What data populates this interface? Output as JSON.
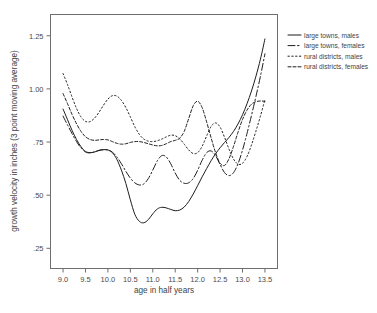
{
  "chart_data": {
    "type": "line",
    "title": "",
    "xlabel": "age in half years",
    "ylabel": "growth velocity in inches (3 point moving average)",
    "xlim": [
      8.72,
      13.78
    ],
    "ylim": [
      0.155,
      1.35
    ],
    "grid": false,
    "legend_position": "right-outside",
    "xticks": [
      "9.0",
      "9.5",
      "10.0",
      "10.5",
      "11.0",
      "11.5",
      "12.0",
      "12.5",
      "13.0",
      "13.5"
    ],
    "xtick_values": [
      9.0,
      9.5,
      10.0,
      10.5,
      11.0,
      11.5,
      12.0,
      12.5,
      13.0,
      13.5
    ],
    "yticks": [
      ".25",
      ".50",
      ".75",
      "1.00",
      "1.25"
    ],
    "ytick_values": [
      0.25,
      0.5,
      0.75,
      1.0,
      1.25
    ],
    "series": [
      {
        "name": "large towns, males",
        "style": "solid",
        "dash": "none",
        "color": "#1d1d1d",
        "x": [
          9.0,
          9.1,
          9.2,
          9.3,
          9.4,
          9.5,
          9.6,
          9.7,
          9.8,
          9.9,
          10.0,
          10.1,
          10.2,
          10.3,
          10.4,
          10.5,
          10.6,
          10.7,
          10.8,
          10.9,
          11.0,
          11.1,
          11.2,
          11.3,
          11.4,
          11.5,
          11.6,
          11.7,
          11.8,
          11.9,
          12.0,
          12.1,
          12.2,
          12.3,
          12.4,
          12.5,
          12.6,
          12.7,
          12.8,
          12.9,
          13.0,
          13.1,
          13.2,
          13.3,
          13.4,
          13.5
        ],
        "y": [
          0.905,
          0.855,
          0.805,
          0.762,
          0.728,
          0.706,
          0.7,
          0.703,
          0.71,
          0.714,
          0.713,
          0.7,
          0.668,
          0.618,
          0.555,
          0.478,
          0.41,
          0.377,
          0.37,
          0.385,
          0.412,
          0.435,
          0.443,
          0.44,
          0.433,
          0.427,
          0.43,
          0.444,
          0.47,
          0.505,
          0.545,
          0.586,
          0.625,
          0.662,
          0.695,
          0.723,
          0.748,
          0.772,
          0.8,
          0.835,
          0.878,
          0.93,
          0.99,
          1.06,
          1.14,
          1.235
        ]
      },
      {
        "name": "large towns, females",
        "style": "dash-dot",
        "dash": "7,2.5,1.5,2.5",
        "color": "#1d1d1d",
        "x": [
          9.0,
          9.1,
          9.2,
          9.3,
          9.4,
          9.5,
          9.6,
          9.7,
          9.8,
          9.9,
          10.0,
          10.1,
          10.2,
          10.3,
          10.4,
          10.5,
          10.6,
          10.7,
          10.8,
          10.9,
          11.0,
          11.1,
          11.2,
          11.3,
          11.4,
          11.5,
          11.6,
          11.7,
          11.8,
          11.9,
          12.0,
          12.1,
          12.2,
          12.3,
          12.4,
          12.5,
          12.6,
          12.7,
          12.8,
          12.9,
          13.0,
          13.1,
          13.2,
          13.3,
          13.4,
          13.5
        ],
        "y": [
          0.872,
          0.83,
          0.79,
          0.752,
          0.722,
          0.703,
          0.699,
          0.704,
          0.711,
          0.714,
          0.712,
          0.702,
          0.68,
          0.648,
          0.612,
          0.58,
          0.558,
          0.548,
          0.553,
          0.578,
          0.618,
          0.661,
          0.686,
          0.68,
          0.648,
          0.604,
          0.57,
          0.556,
          0.558,
          0.578,
          0.617,
          0.664,
          0.7,
          0.708,
          0.686,
          0.644,
          0.606,
          0.592,
          0.606,
          0.648,
          0.712,
          0.79,
          0.875,
          0.965,
          1.06,
          1.165
        ]
      },
      {
        "name": "rural districts, males",
        "style": "dotted",
        "dash": "1.4,2.4",
        "color": "#1d1d1d",
        "x": [
          9.0,
          9.1,
          9.2,
          9.3,
          9.4,
          9.5,
          9.6,
          9.7,
          9.8,
          9.9,
          10.0,
          10.1,
          10.2,
          10.3,
          10.4,
          10.5,
          10.6,
          10.7,
          10.8,
          10.9,
          11.0,
          11.1,
          11.2,
          11.3,
          11.4,
          11.5,
          11.6,
          11.7,
          11.8,
          11.9,
          12.0,
          12.1,
          12.2,
          12.3,
          12.4,
          12.5,
          12.6,
          12.7,
          12.8,
          12.9,
          13.0,
          13.1,
          13.2,
          13.3,
          13.4,
          13.5
        ],
        "y": [
          1.072,
          1.02,
          0.962,
          0.908,
          0.868,
          0.847,
          0.846,
          0.862,
          0.89,
          0.923,
          0.952,
          0.968,
          0.966,
          0.946,
          0.912,
          0.868,
          0.822,
          0.786,
          0.764,
          0.754,
          0.752,
          0.756,
          0.764,
          0.774,
          0.782,
          0.78,
          0.765,
          0.74,
          0.713,
          0.696,
          0.7,
          0.73,
          0.778,
          0.823,
          0.84,
          0.82,
          0.772,
          0.716,
          0.67,
          0.646,
          0.65,
          0.682,
          0.736,
          0.802,
          0.872,
          0.95
        ]
      },
      {
        "name": "rural districts, females",
        "style": "short-dash",
        "dash": "3,2",
        "color": "#1d1d1d",
        "x": [
          9.0,
          9.1,
          9.2,
          9.3,
          9.4,
          9.5,
          9.6,
          9.7,
          9.8,
          9.9,
          10.0,
          10.1,
          10.2,
          10.3,
          10.4,
          10.5,
          10.6,
          10.7,
          10.8,
          10.9,
          11.0,
          11.1,
          11.2,
          11.3,
          11.4,
          11.5,
          11.6,
          11.7,
          11.8,
          11.9,
          12.0,
          12.1,
          12.2,
          12.3,
          12.4,
          12.5,
          12.6,
          12.7,
          12.8,
          12.9,
          13.0,
          13.1,
          13.2,
          13.3,
          13.4,
          13.5
        ],
        "y": [
          0.978,
          0.93,
          0.88,
          0.836,
          0.8,
          0.775,
          0.762,
          0.758,
          0.76,
          0.762,
          0.76,
          0.752,
          0.744,
          0.74,
          0.742,
          0.748,
          0.752,
          0.752,
          0.748,
          0.742,
          0.736,
          0.732,
          0.734,
          0.742,
          0.752,
          0.758,
          0.768,
          0.8,
          0.86,
          0.92,
          0.942,
          0.912,
          0.845,
          0.77,
          0.7,
          0.65,
          0.64,
          0.672,
          0.73,
          0.796,
          0.856,
          0.9,
          0.928,
          0.94,
          0.943,
          0.942
        ]
      }
    ]
  },
  "legend": {
    "entries": [
      {
        "label": "large towns, males"
      },
      {
        "label": "large towns, females"
      },
      {
        "label": "rural districts, males"
      },
      {
        "label": "rural districts, females"
      }
    ]
  }
}
